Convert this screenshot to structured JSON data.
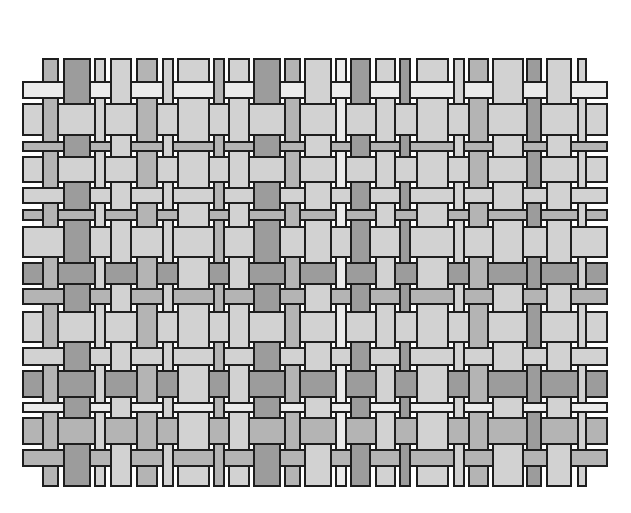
{
  "diagram": {
    "type": "plain-weave-pattern",
    "shades": {
      "very_light": "#ebebeb",
      "light": "#d2d2d2",
      "mid": "#b4b4b4",
      "dark": "#9c9c9c",
      "outline": "#1e1e1e",
      "background": "#ffffff"
    },
    "warp_extent": {
      "top": 58,
      "bottom": 487
    },
    "weft_extent": {
      "left": 22,
      "right": 608
    },
    "columns": [
      {
        "x": 42,
        "w": 17,
        "shade": "mid"
      },
      {
        "x": 63,
        "w": 28,
        "shade": "dark"
      },
      {
        "x": 94,
        "w": 12,
        "shade": "light"
      },
      {
        "x": 110,
        "w": 22,
        "shade": "light"
      },
      {
        "x": 136,
        "w": 22,
        "shade": "mid"
      },
      {
        "x": 162,
        "w": 12,
        "shade": "light"
      },
      {
        "x": 177,
        "w": 33,
        "shade": "light"
      },
      {
        "x": 213,
        "w": 12,
        "shade": "mid"
      },
      {
        "x": 228,
        "w": 22,
        "shade": "light"
      },
      {
        "x": 253,
        "w": 28,
        "shade": "dark"
      },
      {
        "x": 284,
        "w": 17,
        "shade": "mid"
      },
      {
        "x": 304,
        "w": 28,
        "shade": "light"
      },
      {
        "x": 335,
        "w": 12,
        "shade": "very_light"
      },
      {
        "x": 350,
        "w": 21,
        "shade": "dark"
      },
      {
        "x": 375,
        "w": 21,
        "shade": "light"
      },
      {
        "x": 399,
        "w": 12,
        "shade": "dark"
      },
      {
        "x": 416,
        "w": 33,
        "shade": "light"
      },
      {
        "x": 453,
        "w": 12,
        "shade": "light"
      },
      {
        "x": 468,
        "w": 21,
        "shade": "mid"
      },
      {
        "x": 492,
        "w": 32,
        "shade": "light"
      },
      {
        "x": 526,
        "w": 16,
        "shade": "dark"
      },
      {
        "x": 546,
        "w": 26,
        "shade": "light"
      },
      {
        "x": 577,
        "w": 10,
        "shade": "light"
      }
    ],
    "rows": [
      {
        "y": 81,
        "h": 18,
        "shade": "very_light"
      },
      {
        "y": 103,
        "h": 33,
        "shade": "light"
      },
      {
        "y": 141,
        "h": 11,
        "shade": "mid"
      },
      {
        "y": 156,
        "h": 27,
        "shade": "light"
      },
      {
        "y": 187,
        "h": 17,
        "shade": "light"
      },
      {
        "y": 209,
        "h": 12,
        "shade": "mid"
      },
      {
        "y": 226,
        "h": 32,
        "shade": "light"
      },
      {
        "y": 262,
        "h": 23,
        "shade": "dark"
      },
      {
        "y": 288,
        "h": 17,
        "shade": "mid"
      },
      {
        "y": 311,
        "h": 32,
        "shade": "light"
      },
      {
        "y": 347,
        "h": 19,
        "shade": "light"
      },
      {
        "y": 370,
        "h": 28,
        "shade": "dark"
      },
      {
        "y": 402,
        "h": 11,
        "shade": "very_light"
      },
      {
        "y": 417,
        "h": 28,
        "shade": "mid"
      },
      {
        "y": 449,
        "h": 18,
        "shade": "mid"
      }
    ],
    "over_rule": "column over row when (row_index + column_index) is odd"
  }
}
